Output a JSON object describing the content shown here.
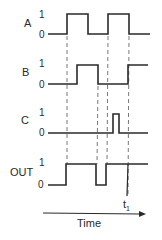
{
  "diagram": {
    "type": "timing-diagram",
    "signals": [
      {
        "name": "A",
        "high_label": "1",
        "low_label": "0",
        "transitions": [
          {
            "t": 67,
            "level": 1
          },
          {
            "t": 88,
            "level": 0
          },
          {
            "t": 108,
            "level": 1
          },
          {
            "t": 129,
            "level": 0
          }
        ]
      },
      {
        "name": "B",
        "high_label": "1",
        "low_label": "0",
        "transitions": [
          {
            "t": 77,
            "level": 1
          },
          {
            "t": 98,
            "level": 0
          },
          {
            "t": 128,
            "level": 1
          }
        ]
      },
      {
        "name": "C",
        "high_label": "1",
        "low_label": "0",
        "transitions": [
          {
            "t": 113,
            "level": 1
          },
          {
            "t": 119,
            "level": 0
          }
        ]
      },
      {
        "name": "OUT",
        "high_label": "1",
        "low_label": "0",
        "transitions": [
          {
            "t": 66,
            "level": 1
          },
          {
            "t": 96,
            "level": 0
          },
          {
            "t": 106,
            "level": 1
          }
        ]
      }
    ],
    "axis": {
      "label": "Time",
      "marker": "t",
      "marker_subscript": "1"
    }
  },
  "labels": {
    "a": "A",
    "b": "B",
    "c": "C",
    "out": "OUT",
    "one": "1",
    "zero": "0",
    "time": "Time",
    "t1_main": "t",
    "t1_sub": "1"
  }
}
